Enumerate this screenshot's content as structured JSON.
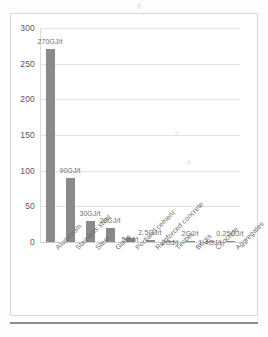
{
  "chart_data": {
    "type": "bar",
    "title": "",
    "subtitle": "",
    "xlabel": "",
    "ylabel": "",
    "ylim": [
      0,
      300
    ],
    "grid": true,
    "legend": false,
    "unit": "GJ/t",
    "bar_color": "#8a8a8a",
    "gridline_color": "#e2e2e2",
    "categories": [
      "Aluminium",
      "Stainless steel",
      "Steel",
      "Glass",
      "Portland cement",
      "Reinforced concrete",
      "Timber",
      "Bricks",
      "Concrete",
      "Aggregates"
    ],
    "values": [
      270,
      90,
      30,
      20,
      5,
      2.5,
      2,
      2,
      1.4,
      0.25
    ],
    "data_labels": [
      "270GJ/t",
      "90GJ/t",
      "30GJ/t",
      "20GJ/t",
      "5GJ/t",
      "2.5GJ/t",
      "2GJ/t",
      "2GJ/t",
      "1.4GJ/t",
      "0.25GJ/t"
    ],
    "yticks": [
      0,
      50,
      100,
      150,
      200,
      250,
      300
    ],
    "ytick_labels": [
      "0",
      "50",
      "100",
      "150",
      "200",
      "250",
      "300"
    ]
  }
}
